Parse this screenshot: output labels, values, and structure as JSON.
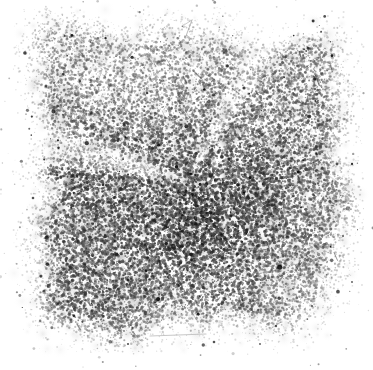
{
  "canvas": {
    "width": 373,
    "height": 370,
    "background_color": "#ffffff",
    "title": "charcoal-rubbing-texture",
    "medium": "charcoal-graphite-grain",
    "description": "Grainy square charcoal smudge with feathered edges on white ground"
  },
  "palette": {
    "paper_white": "#ffffff",
    "lightest_grain": "#d8d8d8",
    "light_gray": "#b4b4b4",
    "mid_gray": "#8a8a8a",
    "dark_gray": "#4e4e4e",
    "darkest_grain": "#141414",
    "speck_black": "#0a0a0a"
  },
  "mass": {
    "bounds": {
      "left": 28,
      "top": 22,
      "right": 348,
      "bottom": 338
    },
    "corner_softness": {
      "top_left": 26,
      "top_right": 34,
      "bottom_left": 46,
      "bottom_right": 44
    },
    "edge_feather_px": 26,
    "overall_opacity": 1.0
  },
  "grain": {
    "seed": 20240517,
    "dot_count": 52000,
    "speck_count": 900,
    "fiber_count": 320,
    "min_dot_radius": 0.35,
    "max_dot_radius": 1.9,
    "coarse_blob_count": 2600
  },
  "density_field": {
    "description": "Local ink density 0..1 sampled across the square; drives dot probability and darkness",
    "nodes": [
      {
        "name": "top-left-edge",
        "x": 55,
        "y": 50,
        "density": 0.34,
        "radius": 62
      },
      {
        "name": "top-light-patch",
        "x": 118,
        "y": 82,
        "density": 0.26,
        "radius": 70
      },
      {
        "name": "top-center",
        "x": 200,
        "y": 60,
        "density": 0.3,
        "radius": 74
      },
      {
        "name": "top-right",
        "x": 300,
        "y": 72,
        "density": 0.46,
        "radius": 78
      },
      {
        "name": "left-dark-blob",
        "x": 80,
        "y": 160,
        "density": 0.92,
        "radius": 62
      },
      {
        "name": "left-mid",
        "x": 52,
        "y": 215,
        "density": 0.52,
        "radius": 54
      },
      {
        "name": "upper-mid-band",
        "x": 175,
        "y": 140,
        "density": 0.62,
        "radius": 70
      },
      {
        "name": "center-core",
        "x": 196,
        "y": 228,
        "density": 0.96,
        "radius": 92
      },
      {
        "name": "center-right-dark",
        "x": 262,
        "y": 196,
        "density": 0.8,
        "radius": 72
      },
      {
        "name": "right-mid",
        "x": 318,
        "y": 200,
        "density": 0.42,
        "radius": 56
      },
      {
        "name": "lower-left",
        "x": 110,
        "y": 268,
        "density": 0.66,
        "radius": 66
      },
      {
        "name": "lower-center",
        "x": 198,
        "y": 300,
        "density": 0.6,
        "radius": 64
      },
      {
        "name": "lower-right-fade",
        "x": 290,
        "y": 292,
        "density": 0.3,
        "radius": 60
      },
      {
        "name": "bottom-edge-spray",
        "x": 170,
        "y": 330,
        "density": 0.22,
        "radius": 58
      }
    ]
  },
  "features": [
    {
      "name": "top-wisp-stroke",
      "type": "fiber",
      "x1": 186,
      "y1": 36,
      "x2": 192,
      "y2": 20,
      "color": "#9a9a9a",
      "width": 0.8
    },
    {
      "name": "top-wisp-hook",
      "type": "fiber",
      "x1": 192,
      "y1": 20,
      "x2": 184,
      "y2": 25,
      "color": "#a8a8a8",
      "width": 0.7
    },
    {
      "name": "bottom-drag-smear",
      "type": "fiber",
      "x1": 150,
      "y1": 336,
      "x2": 206,
      "y2": 334,
      "color": "#bdbdbd",
      "width": 1.1
    }
  ],
  "stray_specks": [
    {
      "x": 46,
      "y": 86,
      "r": 1.5
    },
    {
      "x": 63,
      "y": 74,
      "r": 1.1
    },
    {
      "x": 147,
      "y": 93,
      "r": 1.3
    },
    {
      "x": 244,
      "y": 88,
      "r": 1.6
    },
    {
      "x": 288,
      "y": 120,
      "r": 1.2
    },
    {
      "x": 337,
      "y": 164,
      "r": 1.4
    },
    {
      "x": 343,
      "y": 236,
      "r": 1.0
    },
    {
      "x": 41,
      "y": 276,
      "r": 1.5
    },
    {
      "x": 74,
      "y": 316,
      "r": 1.2
    },
    {
      "x": 128,
      "y": 344,
      "r": 1.1
    },
    {
      "x": 214,
      "y": 342,
      "r": 1.3
    },
    {
      "x": 276,
      "y": 326,
      "r": 1.2
    },
    {
      "x": 312,
      "y": 306,
      "r": 1.0
    },
    {
      "x": 352,
      "y": 282,
      "r": 0.9
    },
    {
      "x": 33,
      "y": 198,
      "r": 1.3
    },
    {
      "x": 260,
      "y": 344,
      "r": 0.9
    }
  ]
}
